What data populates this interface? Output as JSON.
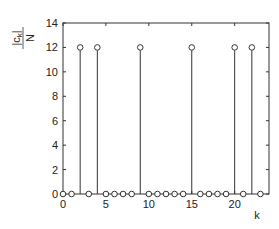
{
  "chart_data": {
    "type": "stem",
    "title": "",
    "xlabel": "k",
    "ylabel": "|c_k| / N",
    "ylabel_numerator": "|c",
    "ylabel_subscript": "k",
    "ylabel_numerator_close": "|",
    "ylabel_denominator": "N",
    "xlim": [
      0,
      24
    ],
    "ylim": [
      0,
      14
    ],
    "xticks": [
      0,
      5,
      10,
      15,
      20
    ],
    "yticks": [
      0,
      2,
      4,
      6,
      8,
      10,
      12,
      14
    ],
    "grid": false,
    "legend": null,
    "x": [
      0,
      1,
      2,
      3,
      4,
      5,
      6,
      7,
      8,
      9,
      10,
      11,
      12,
      13,
      14,
      15,
      16,
      17,
      18,
      19,
      20,
      21,
      22,
      23
    ],
    "values": [
      0,
      0,
      12,
      0,
      12,
      0,
      0,
      0,
      0,
      12,
      0,
      0,
      0,
      0,
      0,
      12,
      0,
      0,
      0,
      0,
      12,
      0,
      12,
      0
    ],
    "marker": "open-circle",
    "line_color": "#333333"
  }
}
